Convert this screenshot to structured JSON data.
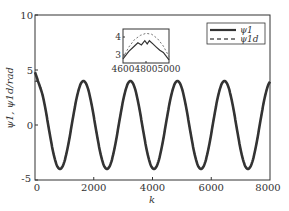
{
  "chart_data": {
    "type": "line",
    "title": "",
    "xlabel": "k",
    "ylabel": "ψ1, ψ1d/rad",
    "xlim": [
      0,
      8000
    ],
    "ylim": [
      -5,
      10
    ],
    "xticks": [
      0,
      2000,
      4000,
      6000,
      8000
    ],
    "yticks": [
      -5,
      0,
      5,
      10
    ],
    "grid": false,
    "legend_position": "upper right",
    "series": [
      {
        "name": "ψ1",
        "style": "solid",
        "color": "#333333",
        "description": "sinusoid with amplitude ~4, period ~1600, starts near 4.8 at k=0",
        "x": [
          0,
          400,
          850,
          1250,
          1650,
          2050,
          2450,
          2850,
          3250,
          3650,
          4050,
          4450,
          4850,
          5250,
          5650,
          6050,
          6450,
          6850,
          7250,
          7650,
          8000
        ],
        "y": [
          4.8,
          0,
          -4,
          0,
          4,
          0,
          -4,
          0,
          4,
          0,
          -4,
          0,
          4,
          0,
          -4,
          0,
          4,
          0,
          -4,
          0,
          3.5
        ]
      },
      {
        "name": "ψ1d",
        "style": "dashed",
        "color": "#555555",
        "description": "reference sinusoid, nearly overlapping ψ1",
        "x": [
          0,
          400,
          850,
          1250,
          1650,
          2050,
          2450,
          2850,
          3250,
          3650,
          4050,
          4450,
          4850,
          5250,
          5650,
          6050,
          6450,
          6850,
          7250,
          7650,
          8000
        ],
        "y": [
          4,
          0,
          -4,
          0,
          4,
          0,
          -4,
          0,
          4,
          0,
          -4,
          0,
          4,
          0,
          -4,
          0,
          4,
          0,
          -4,
          0,
          3.5
        ]
      }
    ],
    "inset": {
      "xlim": [
        4600,
        5000
      ],
      "ylim": [
        2.8,
        4.4
      ],
      "xticks": [
        4600,
        4800,
        5000
      ],
      "yticks": [
        3,
        4
      ],
      "series": [
        {
          "name": "ψ1",
          "style": "solid",
          "x": [
            4600,
            4650,
            4700,
            4730,
            4760,
            4790,
            4810,
            4830,
            4860,
            4890,
            4920,
            4950,
            5000
          ],
          "y": [
            3.0,
            3.35,
            3.6,
            3.75,
            3.65,
            3.85,
            3.7,
            3.85,
            3.7,
            3.55,
            3.4,
            3.3,
            2.95
          ]
        },
        {
          "name": "ψ1d",
          "style": "dashed",
          "x": [
            4600,
            4650,
            4700,
            4750,
            4800,
            4850,
            4900,
            4950,
            5000
          ],
          "y": [
            3.05,
            3.55,
            3.9,
            4.1,
            4.2,
            4.15,
            3.95,
            3.6,
            3.1
          ]
        }
      ]
    }
  },
  "axes": {
    "xlabel": "k",
    "ylabel": "ψ1, ψ1d/rad",
    "xtick_labels": [
      "0",
      "2000",
      "4000",
      "6000",
      "8000"
    ],
    "ytick_labels": [
      "-5",
      "0",
      "5",
      "10"
    ]
  },
  "inset": {
    "xtick_labels": [
      "4600",
      "4800",
      "5000"
    ],
    "ytick_labels": [
      "3",
      "4"
    ]
  },
  "legend": {
    "items": [
      {
        "label": "ψ1",
        "style": "solid"
      },
      {
        "label": "ψ1d",
        "style": "dashed"
      }
    ]
  }
}
